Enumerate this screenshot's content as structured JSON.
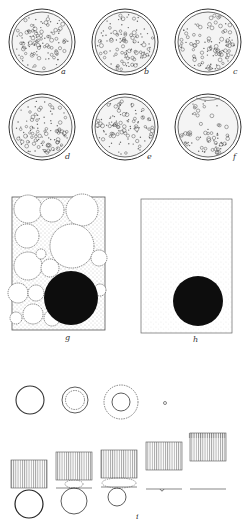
{
  "figure": {
    "panels": [
      {
        "id": "a",
        "label": "a",
        "type": "dish",
        "cx": 42,
        "cy": 42,
        "r": 33,
        "distribution": "uniform-dense"
      },
      {
        "id": "b",
        "label": "b",
        "type": "dish",
        "cx": 125,
        "cy": 42,
        "r": 33,
        "distribution": "uniform-dense"
      },
      {
        "id": "c",
        "label": "c",
        "type": "dish",
        "cx": 208,
        "cy": 42,
        "r": 33,
        "distribution": "settling-bottom"
      },
      {
        "id": "d",
        "label": "d",
        "type": "dish",
        "cx": 42,
        "cy": 127,
        "r": 33,
        "distribution": "settling-bottom"
      },
      {
        "id": "e",
        "label": "e",
        "type": "dish",
        "cx": 125,
        "cy": 127,
        "r": 33,
        "distribution": "uniform"
      },
      {
        "id": "f",
        "label": "f",
        "type": "dish",
        "cx": 208,
        "cy": 127,
        "r": 33,
        "distribution": "sedimented-bottom"
      },
      {
        "id": "g",
        "label": "g",
        "type": "box-packed-spheres",
        "note": "large black sphere among white spheres with stippled interstices"
      },
      {
        "id": "h",
        "label": "h",
        "type": "box-fine-particles",
        "note": "large black sphere in finely stippled medium"
      },
      {
        "id": "i",
        "label": "i",
        "type": "sequence",
        "note": "sphere shrinking at interface under ruled block"
      }
    ],
    "labels": {
      "a": "a",
      "b": "b",
      "c": "c",
      "d": "d",
      "e": "e",
      "f": "f",
      "g": "g",
      "h": "h",
      "i": "i"
    },
    "colors": {
      "ink": "#222222",
      "stipple": "#888888",
      "fill_dark": "#0d0d0d",
      "hatch": "#777777"
    }
  }
}
